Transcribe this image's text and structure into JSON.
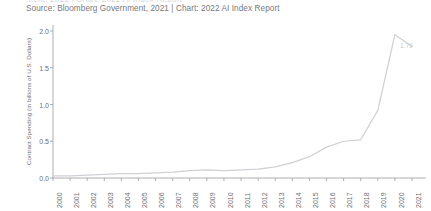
{
  "header": {
    "cropped_title_fragment": "...ent, 2021 | Chart: 2022 AI Index Report",
    "source": "Source: Bloomberg Government, 2021 | Chart: 2022 AI Index Report"
  },
  "style": {
    "line_color": "#d0d0d6",
    "axis_color": "#9a9aa0",
    "text_color": "#6e6e72",
    "label_color": "#c9c9cf",
    "background": "#ffffff"
  },
  "chart_data": {
    "type": "line",
    "title": "",
    "subtitle": "",
    "xlabel": "",
    "ylabel": "Contract Spending (in billions of U.S. Dollars)",
    "categories": [
      "2000",
      "2001",
      "2002",
      "2003",
      "2004",
      "2005",
      "2006",
      "2007",
      "2008",
      "2009",
      "2010",
      "2011",
      "2012",
      "2013",
      "2014",
      "2015",
      "2016",
      "2017",
      "2018",
      "2019",
      "2020",
      "2021"
    ],
    "values": [
      0.03,
      0.03,
      0.04,
      0.05,
      0.06,
      0.06,
      0.07,
      0.08,
      0.1,
      0.11,
      0.1,
      0.11,
      0.12,
      0.15,
      0.21,
      0.29,
      0.42,
      0.5,
      0.52,
      0.92,
      1.95,
      1.79
    ],
    "ylim": [
      0.0,
      2.0
    ],
    "ytick_labels": [
      "0.0",
      "0.5",
      "1.0",
      "1.5",
      "2.0"
    ],
    "ytick_values": [
      0.0,
      0.5,
      1.0,
      1.5,
      2.0
    ],
    "grid": false,
    "legend": false,
    "legend_position": "none",
    "annotations": [
      {
        "text": "1.79",
        "x_category": "2021",
        "y_value": 1.79
      }
    ]
  }
}
